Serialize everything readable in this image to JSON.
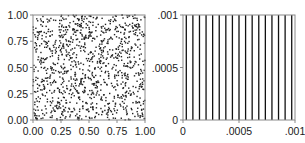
{
  "chart_data": [
    {
      "type": "scatter",
      "title": "",
      "xlabel": "",
      "ylabel": "",
      "xlim": [
        0,
        1
      ],
      "ylim": [
        0,
        1
      ],
      "x_ticks": [
        "0.00",
        "0.25",
        "0.50",
        "0.75",
        "1.00"
      ],
      "y_ticks": [
        "0.00",
        "0.25",
        "0.50",
        "0.75",
        "1.00"
      ],
      "grid": false,
      "legend": null,
      "points": {
        "description": "approximately uniform random points filling unit square",
        "count": 1100,
        "distribution": "uniform",
        "seed": 20240117
      },
      "marker_color": "#222222"
    },
    {
      "type": "line",
      "title": "",
      "xlabel": "",
      "ylabel": "",
      "xlim": [
        0,
        0.001
      ],
      "ylim": [
        0,
        0.001
      ],
      "x_ticks": [
        "0",
        ".0005",
        ".001"
      ],
      "y_ticks": [
        "0",
        ".0005",
        ".001"
      ],
      "grid": false,
      "legend": null,
      "description": "evenly spaced vertical lines spanning full y range",
      "vertical_line_count": 17,
      "vertical_line_x": [
        2.94e-05,
        8.82e-05,
        0.0001471,
        0.0002059,
        0.0002647,
        0.0003235,
        0.0003824,
        0.0004412,
        0.0005,
        0.0005588,
        0.0006176,
        0.0006765,
        0.0007353,
        0.0007941,
        0.0008529,
        0.0009118,
        0.0009706
      ],
      "line_color": "#111111"
    }
  ]
}
